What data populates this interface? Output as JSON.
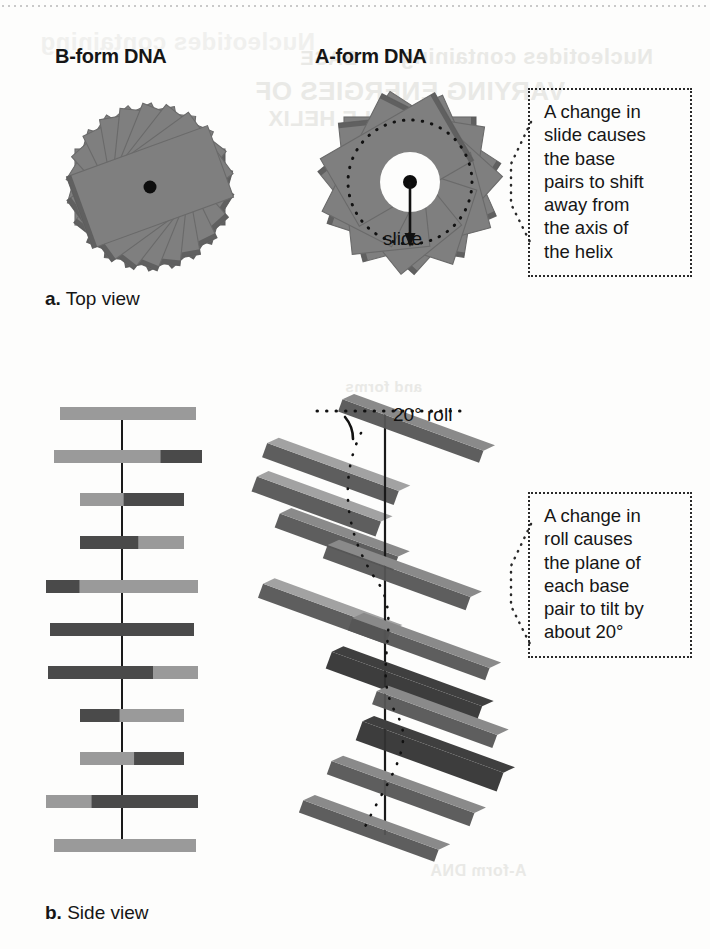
{
  "figure": {
    "columns": [
      {
        "id": "b-form",
        "title": "B-form DNA"
      },
      {
        "id": "a-form",
        "title": "A-form DNA"
      }
    ],
    "panels": [
      {
        "id": "panel-a",
        "letter": "a.",
        "label": "Top view"
      },
      {
        "id": "panel-b",
        "letter": "b.",
        "label": "Side view"
      }
    ],
    "inline_labels": {
      "slide": "slide",
      "roll": "20° roll"
    },
    "callouts": [
      {
        "id": "slide-callout",
        "lines": [
          "A change in",
          "slide causes",
          "the base",
          "pairs to shift",
          "away from",
          "the axis of",
          "the helix"
        ]
      },
      {
        "id": "roll-callout",
        "lines": [
          "A change in",
          "roll causes",
          "the plane of",
          "each base",
          "pair to tilt by",
          "about 20°"
        ]
      }
    ],
    "bleed_through": [
      "Nucleotides containing",
      "BASE",
      "VARYING ENERGIES OF",
      "DOUBLE HELIX",
      "Top view",
      "A-form DNA",
      "and forms"
    ],
    "colors": {
      "ink": "#161616",
      "base_light": "#9a9a9a",
      "base_mid": "#7f7f7f",
      "base_dark": "#4a4a4a",
      "face_light": "#a2a2a2",
      "face_mid": "#8a8a8a",
      "face_dark": "#555555",
      "face_darkest": "#3f3f3f",
      "edge": "#6a6a6a",
      "paper": "#fdfdfc",
      "axis": "#1a1a1a",
      "dot": "#0d0d0d"
    }
  },
  "chart_data": {
    "type": "diagram",
    "b_form_top_view": {
      "description": "Stack of base-pair rectangles viewed down the helix axis; no central hole, axis marked by a black dot.",
      "rectangle_count": 11,
      "rotation_step_degrees": 16,
      "central_hole_radius": 0,
      "axis_dot": true
    },
    "a_form_top_view": {
      "description": "Stack of base-pair rectangles viewed down the helix axis; base pairs slid away from the axis leaving an open central hole.",
      "rectangle_count": 11,
      "rotation_step_degrees": 33,
      "slide_offset_px": 26,
      "central_hole_radius_px": 30,
      "axis_dot": true,
      "slide_arrow": {
        "label": "slide",
        "direction": "down",
        "length_px": 62
      },
      "dotted_circle_radius_px": 62
    },
    "b_form_side_view": {
      "description": "Base pairs seen edge-on: flat horizontal bars perpendicular to the vertical helix axis, 0 degree roll.",
      "bar_count": 12,
      "roll_degrees": 0,
      "bar_spacing_px": 43,
      "bars": [
        {
          "index": 1,
          "y": 12,
          "left": 40,
          "width": 136,
          "dark_start": 0.0,
          "dark_end": 0.0
        },
        {
          "index": 2,
          "y": 55,
          "left": 34,
          "width": 148,
          "dark_start": 0.72,
          "dark_end": 1.0
        },
        {
          "index": 3,
          "y": 98,
          "left": 60,
          "width": 104,
          "dark_start": 0.42,
          "dark_end": 1.0
        },
        {
          "index": 4,
          "y": 141,
          "left": 60,
          "width": 104,
          "dark_start": 0.0,
          "dark_end": 0.56
        },
        {
          "index": 5,
          "y": 185,
          "left": 26,
          "width": 152,
          "dark_start": 0.0,
          "dark_end": 0.22
        },
        {
          "index": 6,
          "y": 228,
          "left": 30,
          "width": 144,
          "dark_start": 0.0,
          "dark_end": 1.0
        },
        {
          "index": 7,
          "y": 271,
          "left": 28,
          "width": 150,
          "dark_start": 0.0,
          "dark_end": 0.7
        },
        {
          "index": 8,
          "y": 314,
          "left": 60,
          "width": 104,
          "dark_start": 0.0,
          "dark_end": 0.38
        },
        {
          "index": 9,
          "y": 357,
          "left": 60,
          "width": 104,
          "dark_start": 0.52,
          "dark_end": 1.0
        },
        {
          "index": 10,
          "y": 400,
          "left": 26,
          "width": 152,
          "dark_start": 0.3,
          "dark_end": 1.0
        },
        {
          "index": 11,
          "y": 444,
          "left": 34,
          "width": 142,
          "dark_start": 0.0,
          "dark_end": 0.0
        }
      ]
    },
    "a_form_side_view": {
      "description": "Base pairs seen edge-on as 3-D slabs tilted about 20 degrees from perpendicular to the helix axis, showing roll.",
      "slab_count": 12,
      "roll_degrees": 20,
      "roll_annotation": "20° roll",
      "vertical_axis": true,
      "dotted_helix_trace": true
    }
  }
}
